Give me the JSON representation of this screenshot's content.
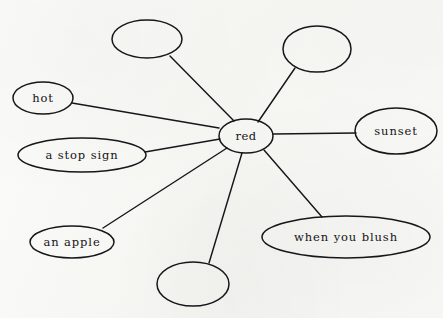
{
  "document": {
    "type": "word-association-web",
    "background_color": "#f8f8f6",
    "ink_color": "#17161a",
    "width": 443,
    "height": 318
  },
  "center_node": {
    "id": "node-red",
    "label": "red",
    "cx": 246,
    "cy": 136,
    "rx": 27,
    "ry": 17
  },
  "leaf_nodes": [
    {
      "id": "node-blank-top-left",
      "label": "",
      "empty": true,
      "cx": 147,
      "cy": 39,
      "rx": 35,
      "ry": 19
    },
    {
      "id": "node-blank-top-right",
      "label": "",
      "empty": true,
      "cx": 317,
      "cy": 49,
      "rx": 34,
      "ry": 23
    },
    {
      "id": "node-hot",
      "label": "hot",
      "empty": false,
      "cx": 43,
      "cy": 98,
      "rx": 30,
      "ry": 16
    },
    {
      "id": "node-sunset",
      "label": "sunset",
      "empty": false,
      "cx": 396,
      "cy": 131,
      "rx": 41,
      "ry": 23
    },
    {
      "id": "node-a-stop-sign",
      "label": "a stop sign",
      "empty": false,
      "cx": 82,
      "cy": 155,
      "rx": 64,
      "ry": 17
    },
    {
      "id": "node-an-apple",
      "label": "an apple",
      "empty": false,
      "cx": 72,
      "cy": 242,
      "rx": 42,
      "ry": 16
    },
    {
      "id": "node-when-you-blush",
      "label": "when you blush",
      "empty": false,
      "cx": 346,
      "cy": 237,
      "rx": 84,
      "ry": 21
    },
    {
      "id": "node-blank-bottom",
      "label": "",
      "empty": true,
      "cx": 193,
      "cy": 284,
      "rx": 36,
      "ry": 22
    }
  ],
  "edges": [
    {
      "id": "edge-red-blank-top-left",
      "from": "node-red",
      "to": "node-blank-top-left",
      "x1": 234,
      "y1": 121,
      "x2": 170,
      "y2": 56
    },
    {
      "id": "edge-red-blank-top-right",
      "from": "node-red",
      "to": "node-blank-top-right",
      "x1": 258,
      "y1": 122,
      "x2": 295,
      "y2": 68
    },
    {
      "id": "edge-red-hot",
      "from": "node-red",
      "to": "node-hot",
      "x1": 219,
      "y1": 128,
      "x2": 72,
      "y2": 103
    },
    {
      "id": "edge-red-sunset",
      "from": "node-red",
      "to": "node-sunset",
      "x1": 273,
      "y1": 134,
      "x2": 356,
      "y2": 133
    },
    {
      "id": "edge-red-a-stop-sign",
      "from": "node-red",
      "to": "node-a-stop-sign",
      "x1": 220,
      "y1": 139,
      "x2": 145,
      "y2": 152
    },
    {
      "id": "edge-red-an-apple",
      "from": "node-red",
      "to": "node-an-apple",
      "x1": 227,
      "y1": 148,
      "x2": 103,
      "y2": 228
    },
    {
      "id": "edge-red-blank-bottom",
      "from": "node-red",
      "to": "node-blank-bottom",
      "x1": 242,
      "y1": 153,
      "x2": 209,
      "y2": 263
    },
    {
      "id": "edge-red-when-you-blush",
      "from": "node-red",
      "to": "node-when-you-blush",
      "x1": 264,
      "y1": 150,
      "x2": 322,
      "y2": 217
    }
  ]
}
